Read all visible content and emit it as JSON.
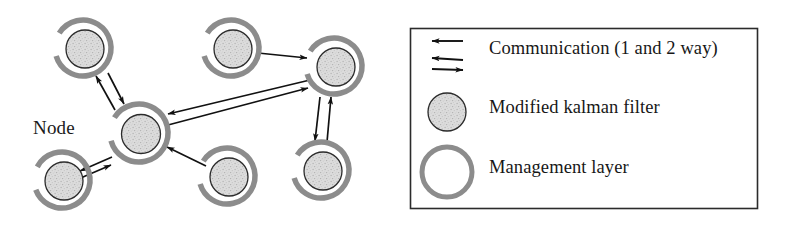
{
  "figure": {
    "type": "network-diagram",
    "background_color": "#ffffff",
    "node_label": "Node",
    "colors": {
      "management_ring": "#8c8c8c",
      "kalman_fill": "#d8d8d8",
      "kalman_stroke": "#2b2b2b",
      "arrow": "#111111",
      "legend_border": "#2b2b2b",
      "text": "#171717"
    },
    "nodes": [
      {
        "id": "n-top-left",
        "cx": 83,
        "cy": 48,
        "name": "node-top-left"
      },
      {
        "id": "n-center",
        "cx": 139,
        "cy": 133,
        "name": "node-center-hub"
      },
      {
        "id": "n-bottom-left",
        "cx": 62,
        "cy": 180,
        "name": "node-bottom-left"
      },
      {
        "id": "n-top-mid",
        "cx": 231,
        "cy": 48,
        "name": "node-top-middle"
      },
      {
        "id": "n-top-right",
        "cx": 334,
        "cy": 66,
        "name": "node-top-right"
      },
      {
        "id": "n-bottom-mid",
        "cx": 227,
        "cy": 176,
        "name": "node-bottom-middle"
      },
      {
        "id": "n-bottom-right",
        "cx": 321,
        "cy": 170,
        "name": "node-bottom-right"
      }
    ],
    "links": [
      {
        "from": "n-center",
        "to": "n-top-left",
        "mode": "2-way",
        "name": "link-center-top-left"
      },
      {
        "from": "n-center",
        "to": "n-bottom-left",
        "mode": "2-way",
        "name": "link-center-bottom-left"
      },
      {
        "from": "n-center",
        "to": "n-top-right",
        "mode": "2-way",
        "name": "link-center-top-right"
      },
      {
        "from": "n-bottom-mid",
        "to": "n-center",
        "mode": "1-way",
        "name": "link-bottom-middle-center"
      },
      {
        "from": "n-top-mid",
        "to": "n-top-right",
        "mode": "1-way",
        "name": "link-top-middle-top-right"
      },
      {
        "from": "n-top-right",
        "to": "n-bottom-right",
        "mode": "2-way",
        "name": "link-top-right-bottom-right"
      }
    ]
  },
  "legend": {
    "box": {
      "x": 410,
      "y": 28,
      "width": 347,
      "height": 180
    },
    "items": [
      {
        "symbol": "double-arrow-icon",
        "label": "Communication (1 and 2 way)"
      },
      {
        "symbol": "filled-circle-icon",
        "label": "Modified kalman filter"
      },
      {
        "symbol": "ring-circle-icon",
        "label": "Management layer"
      }
    ]
  }
}
